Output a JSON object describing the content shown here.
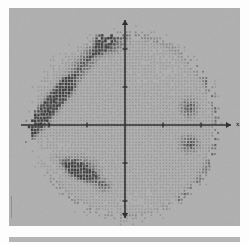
{
  "figure": {
    "kind": "scanned-scatter-density-plot",
    "background_color": "#fdfdfd",
    "panel_color": "#b3b3b3",
    "panel": {
      "x": 9,
      "y": 8,
      "width": 231,
      "height": 218
    },
    "bottom_strip_color": "#b5b5b5"
  },
  "axes": {
    "origin": {
      "x": 116,
      "y": 117
    },
    "axis_color": "#2e2e2e",
    "axis_line_width": 1.6,
    "x_axis": {
      "start_x": 12,
      "end_x": 222,
      "y": 117,
      "arrow": "right",
      "arrow_size": 5
    },
    "y_axis": {
      "x": 116,
      "start_y": 12,
      "end_y": 210,
      "arrow": "both",
      "arrow_size": 5
    },
    "x_label": {
      "text": "x",
      "x": 227,
      "y": 113
    },
    "tick_length": 5,
    "tick_width": 1.4,
    "x_ticks": [
      -2,
      -1,
      1,
      2
    ],
    "y_ticks": [
      -2,
      -1,
      1,
      2
    ],
    "tick_spacing_px": 38
  },
  "chart_data": {
    "type": "scatter",
    "title": "",
    "xlabel": "x",
    "ylabel": "",
    "xlim": [
      -3.05,
      3.05
    ],
    "ylim": [
      -3.05,
      3.05
    ],
    "grid": false,
    "legend": null,
    "marker": {
      "shape": "small-square-dot",
      "base_size_px": 1.45,
      "dark_size_px": 2.5,
      "lattice_spacing_px": 3.05,
      "base_color": "#8a8a8a",
      "mid_color": "#6f6f6f",
      "dark_color": "#3c3c3c"
    },
    "disc": {
      "center": {
        "x": 116,
        "y": 117
      },
      "radius_px": 98,
      "edge_jitter_px": 7,
      "edge_fade": true
    },
    "density_regions": [
      {
        "name": "upper-left-diagonal-band",
        "shape": "band",
        "intensity": 0.95,
        "x1": 24,
        "y1": 118,
        "x2": 96,
        "y2": 30,
        "half_width_px": 11
      },
      {
        "name": "upper-left-band-lower-extension",
        "shape": "band",
        "intensity": 0.88,
        "x1": 18,
        "y1": 128,
        "x2": 58,
        "y2": 80,
        "half_width_px": 12
      },
      {
        "name": "top-center-patch",
        "shape": "blob",
        "intensity": 0.92,
        "cx": 104,
        "cy": 38,
        "rx": 20,
        "ry": 10,
        "angle": -22
      },
      {
        "name": "lower-left-triangle-cluster",
        "shape": "blob",
        "intensity": 1.0,
        "cx": 72,
        "cy": 160,
        "rx": 24,
        "ry": 15,
        "angle": 10
      },
      {
        "name": "lower-left-triangle-tail",
        "shape": "band",
        "intensity": 0.85,
        "x1": 48,
        "y1": 150,
        "x2": 96,
        "y2": 178,
        "half_width_px": 9
      },
      {
        "name": "right-upper-cluster",
        "shape": "blob",
        "intensity": 0.98,
        "cx": 180,
        "cy": 100,
        "rx": 12,
        "ry": 14,
        "angle": 0
      },
      {
        "name": "right-lower-cluster",
        "shape": "blob",
        "intensity": 0.96,
        "cx": 180,
        "cy": 136,
        "rx": 13,
        "ry": 12,
        "angle": 0
      },
      {
        "name": "right-rim-arc",
        "shape": "arc",
        "intensity": 0.7,
        "cx": 116,
        "cy": 117,
        "r": 92,
        "a0": -55,
        "a1": 40,
        "half_width_px": 7
      },
      {
        "name": "upper-rim-arc",
        "shape": "arc",
        "intensity": 0.55,
        "cx": 116,
        "cy": 117,
        "r": 90,
        "a0": 40,
        "a1": 110,
        "half_width_px": 6
      },
      {
        "name": "lower-rim-arc",
        "shape": "arc",
        "intensity": 0.45,
        "cx": 116,
        "cy": 117,
        "r": 91,
        "a0": 200,
        "a1": 300,
        "half_width_px": 6
      },
      {
        "name": "left-lower-sparse-fade",
        "shape": "blob",
        "intensity": -0.55,
        "cx": 40,
        "cy": 150,
        "rx": 26,
        "ry": 22,
        "angle": 0
      },
      {
        "name": "upper-right-quadrant-fade",
        "shape": "blob",
        "intensity": -0.25,
        "cx": 150,
        "cy": 60,
        "rx": 34,
        "ry": 28,
        "angle": 0
      },
      {
        "name": "lower-center-fade",
        "shape": "blob",
        "intensity": -0.3,
        "cx": 120,
        "cy": 196,
        "rx": 40,
        "ry": 16,
        "angle": 0
      }
    ]
  },
  "scan_artifacts": {
    "noise_opacity": 0.3,
    "blur_px": 0.18,
    "vignette": true
  }
}
